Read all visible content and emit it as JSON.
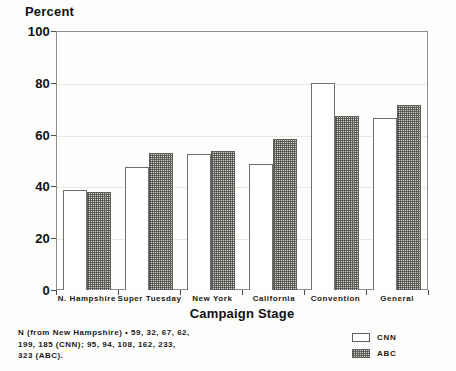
{
  "chart_data": {
    "type": "bar",
    "title": "",
    "ylabel": "Percent",
    "xlabel": "Campaign Stage",
    "ylim": [
      0,
      100
    ],
    "yticks": [
      0,
      20,
      40,
      60,
      80,
      100
    ],
    "grid": true,
    "legend_position": "bottom-right",
    "categories": [
      "N. Hampshire",
      "Super Tuesday",
      "New York",
      "California",
      "Convention",
      "General"
    ],
    "series": [
      {
        "name": "CNN",
        "values": [
          38.5,
          47.5,
          52.5,
          48.5,
          80.0,
          66.5
        ]
      },
      {
        "name": "ABC",
        "values": [
          38.0,
          53.0,
          53.5,
          58.5,
          67.0,
          71.5
        ]
      }
    ],
    "annotations": [
      "N (from New Hampshire) • 59, 32, 67, 62,",
      "199, 185 (CNN); 95, 94, 108, 162, 233,",
      "323 (ABC)."
    ]
  },
  "legend": {
    "items": [
      {
        "label": "CNN",
        "style": "open"
      },
      {
        "label": "ABC",
        "style": "hatched"
      }
    ]
  },
  "colors": {
    "background": "#fdfdfb",
    "axis": "#8d8d8a",
    "grid": "#e9e9e4",
    "cnn_fill": "#ffffff",
    "abc_fill": "#cfcfcb",
    "text": "#1a1a1a"
  }
}
